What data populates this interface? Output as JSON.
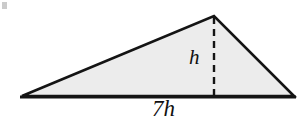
{
  "figure": {
    "kind": "geometry-diagram",
    "shape": "triangle",
    "title": "",
    "background_color": "#ffffff",
    "fill_color": "#ececec",
    "stroke_color": "#141414",
    "dash_color": "#141414",
    "labels": {
      "height": "h",
      "base": "7h"
    },
    "vertices": {
      "left": {
        "x": 22,
        "y": 96
      },
      "apex": {
        "x": 214,
        "y": 16
      },
      "right": {
        "x": 294,
        "y": 96
      }
    },
    "altitude": {
      "from": {
        "x": 214,
        "y": 16
      },
      "to": {
        "x": 214,
        "y": 96
      },
      "style": "dashed",
      "dash_length": 7,
      "dash_gap": 5,
      "stroke_width": 2.4
    },
    "baseline": {
      "from": {
        "x": 20,
        "y": 97
      },
      "to": {
        "x": 296,
        "y": 97
      },
      "stroke_width": 3
    },
    "edge_stroke_width": 2.6,
    "artifact": {
      "name": "scan-speck",
      "color": "#b9b9b9"
    }
  }
}
